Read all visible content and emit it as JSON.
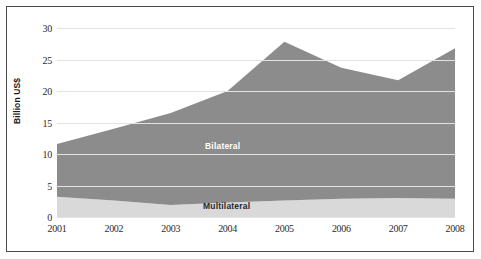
{
  "chart_data": {
    "type": "area",
    "stacked": true,
    "title": "",
    "xlabel": "",
    "ylabel": "Billion US$",
    "categories": [
      "2001",
      "2002",
      "2003",
      "2004",
      "2005",
      "2006",
      "2007",
      "2008"
    ],
    "x": [
      2001,
      2002,
      2003,
      2004,
      2005,
      2006,
      2007,
      2008
    ],
    "series": [
      {
        "name": "Multilateral",
        "color": "#d9d9d9",
        "label_color": "#262626",
        "values": [
          3.2,
          2.6,
          1.9,
          2.3,
          2.6,
          2.9,
          3.0,
          2.9
        ]
      },
      {
        "name": "Bilateral",
        "color": "#8c8c8c",
        "label_color": "#ffffff",
        "values": [
          8.4,
          11.4,
          14.6,
          17.7,
          25.2,
          20.8,
          18.7,
          23.9
        ]
      }
    ],
    "totals": [
      11.6,
      14.0,
      16.5,
      20.0,
      27.8,
      23.7,
      21.7,
      26.8
    ],
    "ylim": [
      0,
      30
    ],
    "yticks": [
      0,
      5,
      10,
      15,
      20,
      25,
      30
    ],
    "ytick_labels": [
      "0",
      "5",
      "10",
      "15",
      "20",
      "25",
      "30"
    ],
    "grid": true,
    "legend": "inline-labels",
    "background": "#ffffff"
  },
  "axis": {
    "y_title": "Billion US$"
  },
  "labels": {
    "bilateral": "Bilateral",
    "multilateral": "Multilateral"
  }
}
